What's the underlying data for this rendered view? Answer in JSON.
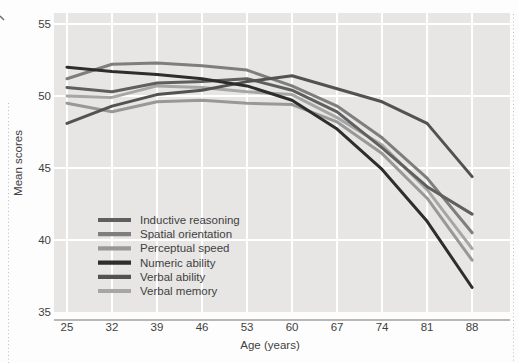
{
  "chart_data": {
    "type": "line",
    "title": "",
    "xlabel": "Age (years)",
    "ylabel": "Mean scores",
    "x": [
      25,
      32,
      39,
      46,
      53,
      60,
      67,
      74,
      81,
      88
    ],
    "xticks": [
      25,
      32,
      39,
      46,
      53,
      60,
      67,
      74,
      81,
      88
    ],
    "yticks": [
      55,
      50,
      45,
      40,
      35
    ],
    "ylim": [
      35,
      55
    ],
    "grid": true,
    "legend_position": "inside-lower-left",
    "series": [
      {
        "name": "Inductive reasoning",
        "color": "#5f5f5f",
        "values": [
          50.6,
          50.3,
          50.9,
          51.0,
          51.2,
          50.4,
          48.9,
          46.4,
          43.7,
          41.8
        ]
      },
      {
        "name": "Spatial orientation",
        "color": "#7e7e7e",
        "values": [
          51.2,
          52.2,
          52.3,
          52.1,
          51.8,
          50.7,
          49.3,
          47.1,
          44.3,
          40.5
        ]
      },
      {
        "name": "Perceptual speed",
        "color": "#989898",
        "values": [
          49.5,
          48.9,
          49.6,
          49.7,
          49.5,
          49.4,
          48.2,
          46.0,
          42.9,
          38.6
        ]
      },
      {
        "name": "Numeric ability",
        "color": "#2d2d2d",
        "values": [
          52.0,
          51.7,
          51.5,
          51.2,
          50.7,
          49.7,
          47.7,
          44.9,
          41.3,
          36.7
        ]
      },
      {
        "name": "Verbal ability",
        "color": "#525252",
        "values": [
          48.1,
          49.3,
          50.1,
          50.4,
          51.0,
          51.4,
          50.5,
          49.6,
          48.1,
          44.4
        ]
      },
      {
        "name": "Verbal memory",
        "color": "#a6a6a6",
        "values": [
          50.0,
          49.9,
          50.7,
          50.6,
          50.3,
          50.1,
          48.5,
          46.6,
          43.5,
          39.4
        ]
      }
    ]
  },
  "style": {
    "page_bg": "#fdfdfd",
    "plot_bg": "#e7e6e4",
    "gridline_color": "#ffffff",
    "axis_line_color": "#9f9f9d",
    "text_color": "#3f3f3f",
    "crop_mark_color": "#bcbcbc"
  }
}
